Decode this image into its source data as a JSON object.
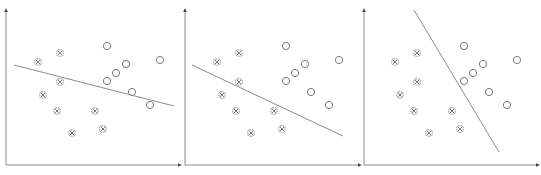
{
  "diagram": {
    "type": "linear-classifier-comparison",
    "colors": {
      "axis": "#8a8a8a",
      "line": "#8c8c8c",
      "marker": "#7a7a7a",
      "background": "#ffffff"
    },
    "panels": [
      {
        "id": "panel-1",
        "origin": [
          6,
          165
        ],
        "x_axis_end": 182,
        "y_axis_top": 8,
        "decision_line": [
          [
            14,
            65
          ],
          [
            174,
            106
          ]
        ]
      },
      {
        "id": "panel-2",
        "origin": [
          185,
          165
        ],
        "x_axis_end": 362,
        "y_axis_top": 8,
        "decision_line": [
          [
            192,
            65
          ],
          [
            343,
            136
          ]
        ]
      },
      {
        "id": "panel-3",
        "origin": [
          364,
          165
        ],
        "x_axis_end": 540,
        "y_axis_top": 8,
        "decision_line": [
          [
            414,
            10
          ],
          [
            499,
            152
          ]
        ]
      }
    ],
    "class_a_crosses": [
      [
        38,
        62
      ],
      [
        60,
        53
      ],
      [
        60,
        82
      ],
      [
        43,
        95
      ],
      [
        57,
        111
      ],
      [
        95,
        111
      ],
      [
        72,
        133
      ],
      [
        103,
        129
      ]
    ],
    "class_b_circles": [
      [
        107,
        46
      ],
      [
        126,
        64
      ],
      [
        116,
        73
      ],
      [
        107,
        81
      ],
      [
        160,
        60
      ],
      [
        132,
        92
      ],
      [
        150,
        105
      ]
    ],
    "panel_x_offsets": [
      0,
      179,
      357
    ]
  }
}
